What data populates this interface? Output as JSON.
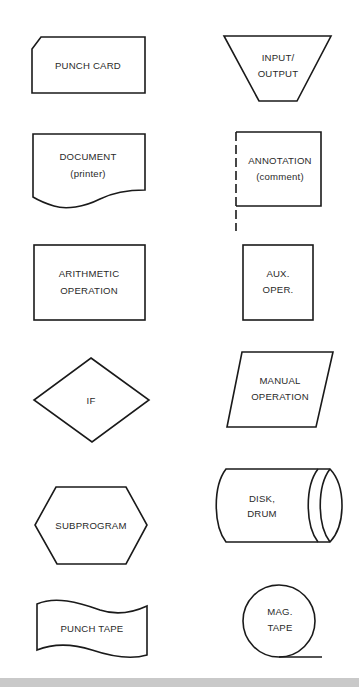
{
  "diagram": {
    "title": "",
    "colors": {
      "stroke": "#1a1a1a",
      "fill": "#ffffff",
      "text": "#2a2a2a",
      "bottom_bar": "#c9c9c9"
    },
    "symbols": {
      "punch_card": {
        "line1": "PUNCH CARD"
      },
      "input_output": {
        "line1": "INPUT/",
        "line2": "OUTPUT"
      },
      "document": {
        "line1": "DOCUMENT",
        "line2": "(printer)"
      },
      "annotation": {
        "line1": "ANNOTATION",
        "line2": "(comment)"
      },
      "arithmetic": {
        "line1": "ARITHMETIC",
        "line2": "OPERATION"
      },
      "aux_oper": {
        "line1": "AUX.",
        "line2": "OPER."
      },
      "if": {
        "line1": "IF"
      },
      "manual": {
        "line1": "MANUAL",
        "line2": "OPERATION"
      },
      "subprogram": {
        "line1": "SUBPROGRAM"
      },
      "disk_drum": {
        "line1": "DISK,",
        "line2": "DRUM"
      },
      "punch_tape": {
        "line1": "PUNCH TAPE"
      },
      "mag_tape": {
        "line1": "MAG.",
        "line2": "TAPE"
      }
    }
  }
}
